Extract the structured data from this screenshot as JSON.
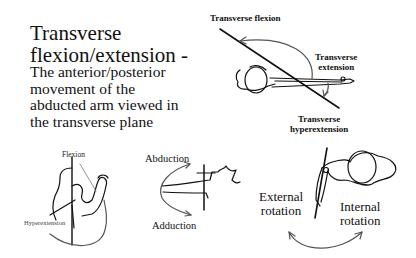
{
  "slide": {
    "title_line1": "Transverse",
    "title_line2": "flexion/extension -",
    "description_lines": [
      "The anterior/posterior",
      "movement of the",
      "abducted arm viewed in",
      "the transverse plane"
    ]
  },
  "top_right_figure": {
    "label_flexion": "Transverse flexion",
    "label_extension_line1": "Transverse",
    "label_extension_line2": "extension",
    "label_hyper_line1": "Transverse",
    "label_hyper_line2": "hyperextension"
  },
  "bottom_left_figure": {
    "label_flexion": "Flexion",
    "label_hyper": "Hyperextension"
  },
  "bottom_middle_figure": {
    "label_abduction": "Abduction",
    "label_adduction": "Adduction"
  },
  "bottom_right_figure": {
    "label_external_line1": "External",
    "label_external_line2": "rotation",
    "label_internal_line1": "Internal",
    "label_internal_line2": "rotation"
  }
}
